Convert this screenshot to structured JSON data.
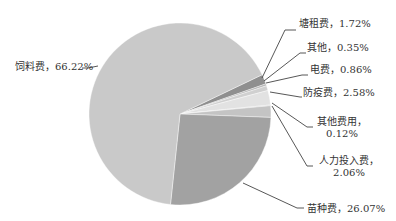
{
  "chart_data": {
    "type": "pie",
    "title": "",
    "slices": [
      {
        "label": "饲料费",
        "value": 66.22,
        "display": "饲料费，66.22%",
        "color": "#c9c9c9"
      },
      {
        "label": "塘租费",
        "value": 1.72,
        "display": "塘租费，1.72%",
        "color": "#8f8f8f"
      },
      {
        "label": "其他",
        "value": 0.35,
        "display": "其他，0.35%",
        "color": "#b5b5b5"
      },
      {
        "label": "电费",
        "value": 0.86,
        "display": "电费，0.86%",
        "color": "#d0d0d0"
      },
      {
        "label": "防疫费",
        "value": 2.58,
        "display": "防疫费，2.58%",
        "color": "#e2e2e2"
      },
      {
        "label": "其他费用",
        "value": 0.12,
        "display": "其他费用，0.12%",
        "color": "#bdbdbd"
      },
      {
        "label": "人力投入费",
        "value": 2.06,
        "display": "人力投入费，2.06%",
        "color": "#c4c4c4"
      },
      {
        "label": "苗种费",
        "value": 26.07,
        "display": "苗种费，26.07%",
        "color": "#a2a2a2"
      }
    ],
    "legend": "none",
    "labels_position": "outside-with-leader-lines"
  },
  "labels": {
    "feed": "饲料费，66.22%",
    "pond_rent": "塘租费，1.72%",
    "other": "其他，0.35%",
    "electricity": "电费，0.86%",
    "epidemic": "防疫费，2.58%",
    "other_cost_1": "其他费用，",
    "other_cost_2": "0.12%",
    "labor_1": "人力投入费，",
    "labor_2": "2.06%",
    "seed": "苗种费，26.07%"
  }
}
